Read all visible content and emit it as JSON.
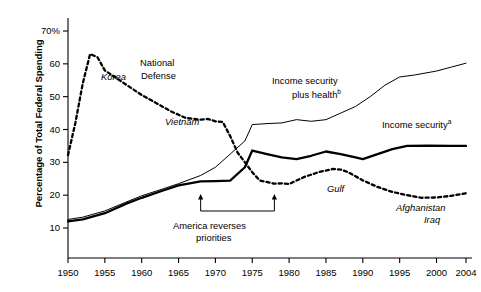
{
  "chart_data": {
    "type": "line",
    "title": "",
    "xlabel": "",
    "ylabel": "Percentage of Total Federal Spending",
    "xlim": [
      1950,
      2004
    ],
    "ylim": [
      6,
      72
    ],
    "grid": false,
    "legend_position": "inline-annotations",
    "x_ticks": [
      1950,
      1955,
      1960,
      1965,
      1970,
      1975,
      1980,
      1985,
      1990,
      1995,
      2000,
      2004
    ],
    "x_tick_labels": [
      "1950",
      "1955",
      "1960",
      "1965",
      "1970",
      "1975",
      "1980",
      "1985",
      "1990",
      "1995",
      "2000",
      "2004"
    ],
    "y_ticks": [
      10,
      20,
      30,
      40,
      50,
      60,
      70
    ],
    "y_tick_labels": [
      "10",
      "20",
      "30",
      "40",
      "50",
      "60",
      "70%"
    ],
    "series": [
      {
        "name": "National Defense",
        "style": "dashed",
        "width": "thick",
        "color": "#000000",
        "points": [
          [
            1950,
            32.2
          ],
          [
            1951,
            42.0
          ],
          [
            1952,
            54.0
          ],
          [
            1953,
            63.0
          ],
          [
            1954,
            62.0
          ],
          [
            1955,
            58.0
          ],
          [
            1956,
            56.5
          ],
          [
            1958,
            53.5
          ],
          [
            1960,
            50.5
          ],
          [
            1962,
            48.0
          ],
          [
            1964,
            45.5
          ],
          [
            1966,
            43.5
          ],
          [
            1968,
            43.0
          ],
          [
            1969,
            43.2
          ],
          [
            1970,
            42.5
          ],
          [
            1971,
            42.3
          ],
          [
            1972,
            38.0
          ],
          [
            1973,
            33.0
          ],
          [
            1974,
            30.0
          ],
          [
            1975,
            27.0
          ],
          [
            1976,
            24.5
          ],
          [
            1978,
            23.5
          ],
          [
            1979,
            23.6
          ],
          [
            1980,
            23.4
          ],
          [
            1982,
            25.5
          ],
          [
            1984,
            27.0
          ],
          [
            1986,
            28.0
          ],
          [
            1987,
            27.8
          ],
          [
            1988,
            27.0
          ],
          [
            1990,
            24.5
          ],
          [
            1992,
            22.5
          ],
          [
            1994,
            21.0
          ],
          [
            1996,
            20.0
          ],
          [
            1998,
            19.2
          ],
          [
            2000,
            19.3
          ],
          [
            2002,
            19.8
          ],
          [
            2004,
            20.6
          ]
        ]
      },
      {
        "name": "Income security plus health",
        "style": "solid",
        "width": "thin",
        "color": "#000000",
        "points": [
          [
            1950,
            12.6
          ],
          [
            1952,
            13.3
          ],
          [
            1955,
            15.2
          ],
          [
            1958,
            18.0
          ],
          [
            1960,
            19.8
          ],
          [
            1963,
            22.0
          ],
          [
            1965,
            23.5
          ],
          [
            1968,
            26.0
          ],
          [
            1970,
            28.5
          ],
          [
            1972,
            32.5
          ],
          [
            1974,
            36.5
          ],
          [
            1975,
            41.5
          ],
          [
            1977,
            41.8
          ],
          [
            1979,
            42.0
          ],
          [
            1981,
            43.0
          ],
          [
            1983,
            42.5
          ],
          [
            1985,
            43.0
          ],
          [
            1987,
            45.0
          ],
          [
            1989,
            47.0
          ],
          [
            1991,
            50.0
          ],
          [
            1993,
            53.5
          ],
          [
            1995,
            56.0
          ],
          [
            1997,
            56.6
          ],
          [
            2000,
            57.8
          ],
          [
            2002,
            59.0
          ],
          [
            2004,
            60.2
          ]
        ]
      },
      {
        "name": "Income security",
        "style": "solid",
        "width": "thick",
        "color": "#000000",
        "points": [
          [
            1950,
            12.0
          ],
          [
            1952,
            12.6
          ],
          [
            1955,
            14.5
          ],
          [
            1958,
            17.5
          ],
          [
            1960,
            19.2
          ],
          [
            1963,
            21.5
          ],
          [
            1965,
            23.0
          ],
          [
            1968,
            24.2
          ],
          [
            1970,
            24.3
          ],
          [
            1972,
            24.4
          ],
          [
            1974,
            28.5
          ],
          [
            1975,
            33.6
          ],
          [
            1977,
            32.5
          ],
          [
            1979,
            31.5
          ],
          [
            1981,
            31.0
          ],
          [
            1983,
            32.0
          ],
          [
            1985,
            33.3
          ],
          [
            1987,
            32.5
          ],
          [
            1989,
            31.5
          ],
          [
            1990,
            31.0
          ],
          [
            1992,
            32.5
          ],
          [
            1994,
            34.0
          ],
          [
            1996,
            35.0
          ],
          [
            1999,
            35.1
          ],
          [
            2002,
            35.0
          ],
          [
            2004,
            35.0
          ]
        ]
      }
    ],
    "annotations": [
      {
        "name": "korea-label",
        "text": "Korea",
        "italic": true,
        "x": 101,
        "y": 71
      },
      {
        "name": "national-defense-label",
        "text": "National",
        "italic": false,
        "x": 140,
        "y": 57
      },
      {
        "name": "national-defense-label-2",
        "text": "Defense",
        "italic": false,
        "x": 141,
        "y": 70
      },
      {
        "name": "vietnam-label",
        "text": "Vietnam",
        "italic": true,
        "x": 165,
        "y": 116
      },
      {
        "name": "income-security-plus-health-label",
        "text": "Income security",
        "italic": false,
        "x": 272,
        "y": 75
      },
      {
        "name": "income-security-plus-health-label-2",
        "text": "plus health",
        "italic": false,
        "x": 292,
        "y": 86,
        "sup": "b"
      },
      {
        "name": "income-security-label",
        "text": "Income security",
        "italic": false,
        "x": 382,
        "y": 116,
        "sup": "a"
      },
      {
        "name": "gulf-label",
        "text": "Gulf",
        "italic": true,
        "x": 327,
        "y": 183
      },
      {
        "name": "afghanistan-label",
        "text": "Afghanistan",
        "italic": true,
        "x": 396,
        "y": 202
      },
      {
        "name": "iraq-label",
        "text": "Iraq",
        "italic": true,
        "x": 424,
        "y": 214
      },
      {
        "name": "america-reverses-label",
        "text": "America reverses",
        "italic": false,
        "x": 173,
        "y": 220
      },
      {
        "name": "priorities-label",
        "text": "priorities",
        "italic": false,
        "x": 196,
        "y": 232
      }
    ],
    "bracket": {
      "name": "america-reverses-priorities-bracket",
      "label_line1": "America reverses",
      "label_line2": "priorities",
      "x_start": 1968,
      "x_end": 1978
    }
  }
}
